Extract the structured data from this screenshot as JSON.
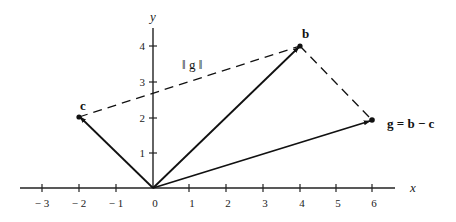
{
  "diagram": {
    "type": "vector-plot",
    "axes": {
      "x_label": "x",
      "y_label": "y",
      "x_ticks": [
        {
          "value": -3,
          "label": "− 3"
        },
        {
          "value": -2,
          "label": "− 2"
        },
        {
          "value": -1,
          "label": "− 1"
        },
        {
          "value": 0,
          "label": "0"
        },
        {
          "value": 1,
          "label": "1"
        },
        {
          "value": 2,
          "label": "2"
        },
        {
          "value": 3,
          "label": "3"
        },
        {
          "value": 4,
          "label": "4"
        },
        {
          "value": 5,
          "label": "5"
        },
        {
          "value": 6,
          "label": "6"
        }
      ],
      "y_ticks": [
        {
          "value": 1,
          "label": "1"
        },
        {
          "value": 2,
          "label": "2"
        },
        {
          "value": 3,
          "label": "3"
        },
        {
          "value": 4,
          "label": "4"
        }
      ]
    },
    "vectors": [
      {
        "name": "c",
        "label": "c",
        "from": [
          0,
          0
        ],
        "to": [
          -2,
          2
        ]
      },
      {
        "name": "b",
        "label": "b",
        "from": [
          0,
          0
        ],
        "to": [
          4,
          4
        ]
      },
      {
        "name": "g",
        "label": "g = b − c",
        "from": [
          0,
          0
        ],
        "to": [
          6,
          2
        ]
      }
    ],
    "dashed_segments": [
      {
        "name": "c-to-b",
        "from": [
          -2,
          2
        ],
        "to": [
          4,
          4
        ],
        "label": "‖ g ‖"
      },
      {
        "name": "b-to-g",
        "from": [
          4,
          4
        ],
        "to": [
          6,
          2
        ]
      }
    ],
    "labels": {
      "c": "c",
      "b": "b",
      "g": "g = b − c",
      "norm": "‖ g ‖"
    }
  }
}
